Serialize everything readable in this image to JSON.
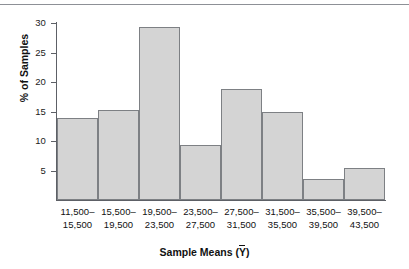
{
  "chart_data": {
    "type": "bar",
    "title": "",
    "xlabel": "Sample Means (Ȳ)",
    "ylabel": "% of Samples",
    "categories": [
      "11,500–15,500",
      "15,500–19,500",
      "19,500–23,500",
      "23,500–27,500",
      "27,500–31,500",
      "31,500–35,500",
      "35,500–39,500",
      "39,500–43,500"
    ],
    "category_lines": [
      [
        "11,500–",
        "15,500"
      ],
      [
        "15,500–",
        "19,500"
      ],
      [
        "19,500–",
        "23,500"
      ],
      [
        "23,500–",
        "27,500"
      ],
      [
        "27,500–",
        "31,500"
      ],
      [
        "31,500–",
        "35,500"
      ],
      [
        "35,500–",
        "39,500"
      ],
      [
        "39,500–",
        "43,500"
      ]
    ],
    "values": [
      13.9,
      15.2,
      29.3,
      9.4,
      18.9,
      15.0,
      3.5,
      5.4
    ],
    "ylim": [
      0,
      30
    ],
    "yticks": [
      5,
      10,
      15,
      20,
      25,
      30
    ],
    "ytick_labels": [
      "5",
      "10",
      "15",
      "20",
      "25",
      "30"
    ],
    "grid": false,
    "legend": "none",
    "bar_fill": "#d4d4d4",
    "bar_border": "#7d8084",
    "axis_color": "#5d6066"
  },
  "axis": {
    "y_title": "% of Samples",
    "x_title_prefix": "Sample Means (",
    "x_title_var": "Y",
    "x_title_suffix": ")"
  }
}
